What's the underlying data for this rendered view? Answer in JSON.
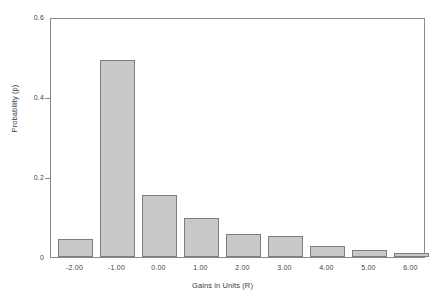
{
  "chart_data": {
    "type": "bar",
    "title": "",
    "xlabel": "Gains in Units (R)",
    "ylabel": "Probability (p)",
    "categories": [
      "-2.00",
      "-1.00",
      "0.00",
      "1.00",
      "2.00",
      "3.00",
      "4.00",
      "5.00",
      "6.00"
    ],
    "values": [
      0.045,
      0.492,
      0.156,
      0.098,
      0.058,
      0.052,
      0.027,
      0.017,
      0.01
    ],
    "ylim": [
      0,
      0.6
    ],
    "yticks": [
      0,
      0.2,
      0.4,
      0.6
    ],
    "ytick_labels": [
      "0",
      "0.2",
      "0.4",
      "0.6"
    ],
    "grid": false,
    "legend": null,
    "bar_fill_color": "#c9c9c9",
    "bar_edge_color": "#7d7d7d",
    "axis_color": "#8a8a8a",
    "background_color": "#ffffff"
  }
}
